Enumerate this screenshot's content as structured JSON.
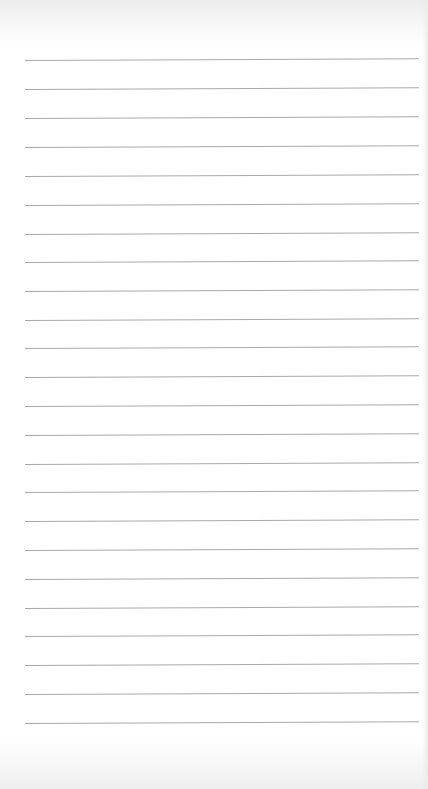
{
  "paper": {
    "type": "lined-paper",
    "background_color": "#ffffff",
    "line_color": "#a9a9a9",
    "line_count": 24,
    "line_left_px": 25,
    "line_right_px": 419,
    "line_positions_y": [
      60,
      89,
      118,
      147,
      176,
      205,
      234,
      262,
      291,
      320,
      348,
      377,
      406,
      435,
      464,
      492,
      521,
      550,
      579,
      608,
      636,
      665,
      694,
      723
    ]
  }
}
